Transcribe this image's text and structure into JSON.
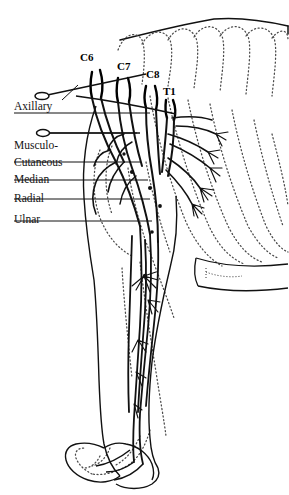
{
  "figure": {
    "background_color": "#ffffff",
    "ink_color": "#111111",
    "dotted_color": "#555555",
    "width": 289,
    "height": 495
  },
  "spinal_roots": [
    {
      "id": "c6",
      "label": "C6",
      "x": 80,
      "y": 58
    },
    {
      "id": "c7",
      "label": "C7",
      "x": 116,
      "y": 66
    },
    {
      "id": "c8",
      "label": "C8",
      "x": 146,
      "y": 74
    },
    {
      "id": "t1",
      "label": "T1",
      "x": 164,
      "y": 90
    }
  ],
  "nerve_labels": [
    {
      "id": "axillary",
      "label": "Axillary",
      "x": 14,
      "y": 100,
      "leader_y": 113,
      "leader_x2": 150
    },
    {
      "id": "musculo",
      "label": "Musculo-",
      "x": 14,
      "y": 141,
      "leader_y": 133,
      "leader_x2": 137
    },
    {
      "id": "cutaneous",
      "label": "Cutaneous",
      "x": 14,
      "y": 157,
      "leader_y": 162,
      "leader_x2": 140
    },
    {
      "id": "median",
      "label": "Median",
      "x": 14,
      "y": 173,
      "leader_y": 180,
      "leader_x2": 148
    },
    {
      "id": "radial",
      "label": "Radial",
      "x": 14,
      "y": 190,
      "leader_y": 199,
      "leader_x2": 150
    },
    {
      "id": "ulnar",
      "label": "Ulnar",
      "x": 14,
      "y": 212,
      "leader_y": 221,
      "leader_x2": 152
    }
  ],
  "markers": [
    {
      "id": "electrode-upper",
      "x": 38,
      "y": 94,
      "angle": -12,
      "length": 108
    },
    {
      "id": "electrode-lower",
      "x": 36,
      "y": 133,
      "angle": 0,
      "length": 104
    }
  ],
  "anatomy": {
    "regions": [
      "dorsal-outline",
      "rib-cage-dotted",
      "scapula",
      "humerus",
      "radius-ulna",
      "carpus-paw",
      "brachial-plexus"
    ]
  }
}
